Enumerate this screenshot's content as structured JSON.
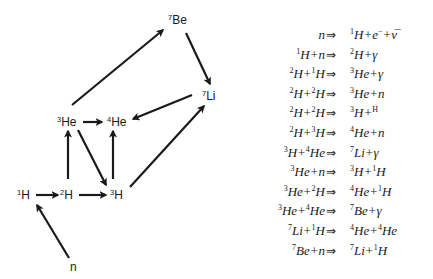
{
  "diagram": {
    "nodes": [
      {
        "id": "n",
        "mass": "",
        "sym": "n",
        "x": 70,
        "y": 261
      },
      {
        "id": "H1",
        "mass": "1",
        "sym": "H",
        "x": 17,
        "y": 189
      },
      {
        "id": "H2",
        "mass": "2",
        "sym": "H",
        "x": 60,
        "y": 189
      },
      {
        "id": "H3",
        "mass": "3",
        "sym": "H",
        "x": 110,
        "y": 189
      },
      {
        "id": "He3",
        "mass": "3",
        "sym": "He",
        "x": 57,
        "y": 116
      },
      {
        "id": "He4",
        "mass": "4",
        "sym": "He",
        "x": 107,
        "y": 116
      },
      {
        "id": "Be7",
        "mass": "7",
        "sym": "Be",
        "x": 168,
        "y": 14
      },
      {
        "id": "Li7",
        "mass": "7",
        "sym": "Li",
        "x": 202,
        "y": 90
      }
    ],
    "edges": [
      {
        "from": "n",
        "to": "H1",
        "x1": 69,
        "y1": 258,
        "x2": 37,
        "y2": 205
      },
      {
        "from": "H1",
        "to": "H2",
        "x1": 36,
        "y1": 195,
        "x2": 58,
        "y2": 195
      },
      {
        "from": "H2",
        "to": "H3",
        "x1": 79,
        "y1": 195,
        "x2": 106,
        "y2": 195
      },
      {
        "from": "H2",
        "to": "He3",
        "x1": 68,
        "y1": 179,
        "x2": 68,
        "y2": 131
      },
      {
        "from": "H3",
        "to": "He4",
        "x1": 113,
        "y1": 179,
        "x2": 113,
        "y2": 131
      },
      {
        "from": "He3",
        "to": "H3",
        "x1": 78,
        "y1": 130,
        "x2": 106,
        "y2": 185
      },
      {
        "from": "He3",
        "to": "He4",
        "x1": 83,
        "y1": 122,
        "x2": 102,
        "y2": 122
      },
      {
        "from": "He3",
        "to": "Be7",
        "x1": 72,
        "y1": 105,
        "x2": 163,
        "y2": 30
      },
      {
        "from": "Be7",
        "to": "Li7",
        "x1": 186,
        "y1": 33,
        "x2": 210,
        "y2": 84
      },
      {
        "from": "Li7",
        "to": "He4",
        "x1": 192,
        "y1": 95,
        "x2": 133,
        "y2": 119
      },
      {
        "from": "H3",
        "to": "Li7",
        "x1": 130,
        "y1": 187,
        "x2": 204,
        "y2": 106
      }
    ]
  },
  "reactions": {
    "arrow": "⇒",
    "rows": [
      {
        "lhs": [
          [
            "",
            "n"
          ]
        ],
        "rhs": [
          [
            "1",
            "H"
          ],
          [
            "",
            "+"
          ],
          [
            "",
            "e"
          ],
          [
            "−",
            ""
          ],
          [
            "",
            "+"
          ],
          [
            "",
            "ν̅"
          ]
        ]
      },
      {
        "lhs": [
          [
            "1",
            "H"
          ],
          [
            "",
            "+n"
          ]
        ],
        "rhs": [
          [
            "2",
            "H"
          ],
          [
            "",
            "+γ"
          ]
        ]
      },
      {
        "lhs": [
          [
            "2",
            "H"
          ],
          [
            "",
            "+"
          ],
          [
            "1",
            "H"
          ]
        ],
        "rhs": [
          [
            "3",
            "He"
          ],
          [
            "",
            "+γ"
          ]
        ]
      },
      {
        "lhs": [
          [
            "2",
            "H"
          ],
          [
            "",
            "+"
          ],
          [
            "2",
            "H"
          ]
        ],
        "rhs": [
          [
            "3",
            "He"
          ],
          [
            "",
            "+n"
          ]
        ]
      },
      {
        "lhs": [
          [
            "2",
            "H"
          ],
          [
            "",
            "+"
          ],
          [
            "2",
            "H"
          ]
        ],
        "rhs": [
          [
            "3",
            "H"
          ],
          [
            "",
            "+"
          ],
          [
            "H",
            ""
          ]
        ]
      },
      {
        "lhs": [
          [
            "2",
            "H"
          ],
          [
            "",
            "+"
          ],
          [
            "3",
            "H"
          ]
        ],
        "rhs": [
          [
            "4",
            "He"
          ],
          [
            "",
            "+n"
          ]
        ]
      },
      {
        "lhs": [
          [
            "3",
            "H"
          ],
          [
            "",
            "+"
          ],
          [
            "4",
            "He"
          ]
        ],
        "rhs": [
          [
            "7",
            "Li"
          ],
          [
            "",
            "+γ"
          ]
        ]
      },
      {
        "lhs": [
          [
            "3",
            "He"
          ],
          [
            "",
            "+n"
          ]
        ],
        "rhs": [
          [
            "3",
            "H"
          ],
          [
            "",
            "+"
          ],
          [
            "1",
            "H"
          ]
        ]
      },
      {
        "lhs": [
          [
            "3",
            "He"
          ],
          [
            "",
            "+"
          ],
          [
            "2",
            "H"
          ]
        ],
        "rhs": [
          [
            "4",
            "He"
          ],
          [
            "",
            "+"
          ],
          [
            "1",
            "H"
          ]
        ]
      },
      {
        "lhs": [
          [
            "3",
            "He"
          ],
          [
            "",
            "+"
          ],
          [
            "4",
            "He"
          ]
        ],
        "rhs": [
          [
            "7",
            "Be"
          ],
          [
            "",
            "+γ"
          ]
        ]
      },
      {
        "lhs": [
          [
            "7",
            "Li"
          ],
          [
            "",
            "+"
          ],
          [
            "1",
            "H"
          ]
        ],
        "rhs": [
          [
            "4",
            "He"
          ],
          [
            "",
            "+"
          ],
          [
            "4",
            "He"
          ]
        ]
      },
      {
        "lhs": [
          [
            "7",
            "Be"
          ],
          [
            "",
            "+n"
          ]
        ],
        "rhs": [
          [
            "7",
            "Li"
          ],
          [
            "",
            "+"
          ],
          [
            "1",
            "H"
          ]
        ]
      }
    ]
  },
  "colors": {
    "ink": "#1a1a1a",
    "background": "#ffffff"
  }
}
